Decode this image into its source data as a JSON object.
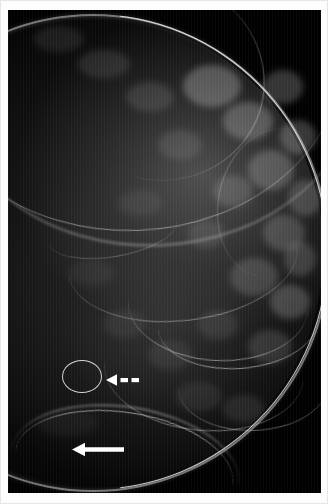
{
  "figure": {
    "modality": "mammogram",
    "view_description": "Craniocaudal mammographic view of the breast",
    "background_color": "#ffffff",
    "film_color": "#000000",
    "annotation_color": "#ffffff",
    "ellipse_color": "#d2d2d2"
  },
  "annotations": [
    {
      "name": "lesion-ellipse",
      "shape": "ellipse-outline",
      "label": "Circled lesion",
      "color": "#d2d2d2"
    },
    {
      "name": "dashed-arrow",
      "shape": "dashed-arrow-left",
      "label": "Dashed arrow indicating circled finding",
      "color": "#ffffff"
    },
    {
      "name": "solid-arrow",
      "shape": "solid-arrow-left",
      "label": "Solid arrow indicating inferior finding",
      "color": "#ffffff"
    }
  ],
  "anatomy": {
    "skin_line": "skin-line",
    "parenchyma": "fibroglandular-tissue",
    "vessels": "curvilinear-vascular-markings"
  }
}
